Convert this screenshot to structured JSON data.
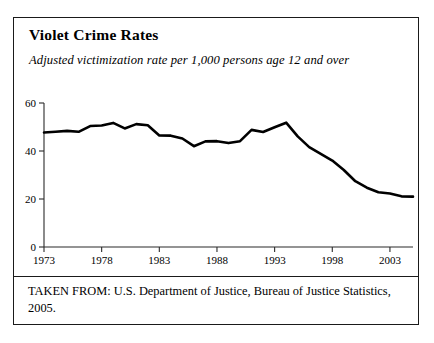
{
  "figure": {
    "title": "Violet Crime Rates",
    "subtitle": "Adjusted victimization rate per 1,000 persons age 12 and over",
    "source_note": "TAKEN FROM: U.S. Department of Justice, Bureau of Justice Statistics, 2005."
  },
  "chart_data": {
    "type": "line",
    "title": "Violet Crime Rates",
    "subtitle": "Adjusted victimization rate per 1,000 persons age 12 and over",
    "xlabel": "",
    "ylabel": "",
    "xlim": [
      1973,
      2005
    ],
    "ylim": [
      0,
      60
    ],
    "yticks": [
      0,
      20,
      40,
      60
    ],
    "ytick_labels": [
      "0",
      "20",
      "40",
      "60"
    ],
    "xticks": [
      1973,
      1978,
      1983,
      1988,
      1993,
      1998,
      2003
    ],
    "xtick_labels": [
      "1973",
      "1978",
      "1983",
      "1988",
      "1993",
      "1998",
      "2003"
    ],
    "grid": false,
    "legend": "none",
    "line_color": "#000000",
    "line_width_px": 2.6,
    "x": [
      1973,
      1974,
      1975,
      1976,
      1977,
      1978,
      1979,
      1980,
      1981,
      1982,
      1983,
      1984,
      1985,
      1986,
      1987,
      1988,
      1989,
      1990,
      1991,
      1992,
      1993,
      1994,
      1995,
      1996,
      1997,
      1998,
      1999,
      2000,
      2001,
      2002,
      2003,
      2004,
      2005
    ],
    "values": [
      47.7,
      48.0,
      48.4,
      48.0,
      50.4,
      50.6,
      51.7,
      49.4,
      51.2,
      50.7,
      46.5,
      46.4,
      45.2,
      42.0,
      44.0,
      44.1,
      43.3,
      44.1,
      48.8,
      47.9,
      49.9,
      51.8,
      46.1,
      41.6,
      38.8,
      36.0,
      32.1,
      27.4,
      24.7,
      22.8,
      22.3,
      21.1,
      21.0
    ]
  }
}
